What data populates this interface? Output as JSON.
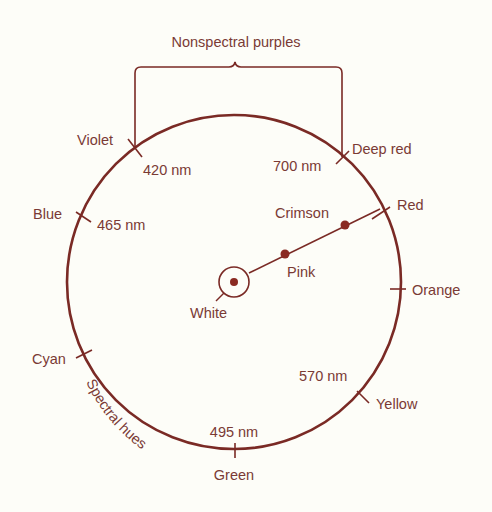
{
  "diagram": {
    "colors": {
      "line": "#7a2a25",
      "text": "#7a3a35",
      "background": "#fdfdf8"
    },
    "bracket": {
      "label": "Nonspectral purples"
    },
    "arc_label": "Spectral hues",
    "hues": [
      {
        "name": "Violet",
        "wavelength": "420 nm"
      },
      {
        "name": "Deep red",
        "wavelength": "700 nm"
      },
      {
        "name": "Blue",
        "wavelength": "465 nm"
      },
      {
        "name": "Red",
        "wavelength": ""
      },
      {
        "name": "Orange",
        "wavelength": ""
      },
      {
        "name": "Cyan",
        "wavelength": ""
      },
      {
        "name": "Yellow",
        "wavelength": "570 nm"
      },
      {
        "name": "Green",
        "wavelength": "495 nm"
      }
    ],
    "saturation_line": {
      "points": [
        {
          "name": "White"
        },
        {
          "name": "Pink"
        },
        {
          "name": "Crimson"
        }
      ]
    }
  }
}
